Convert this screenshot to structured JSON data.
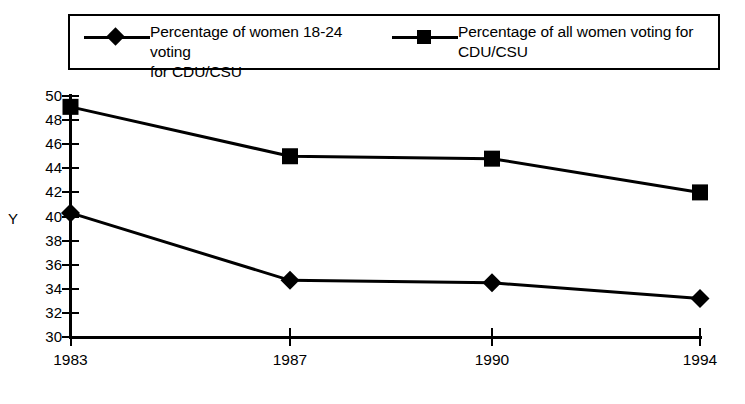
{
  "chart_data": {
    "type": "line",
    "title": "",
    "xlabel": "",
    "ylabel": "Y",
    "categories": [
      "1983",
      "1987",
      "1990",
      "1994"
    ],
    "ylim": [
      30,
      50
    ],
    "yticks": [
      30,
      32,
      34,
      36,
      38,
      40,
      42,
      44,
      46,
      48,
      50
    ],
    "ytick_labels": [
      "30",
      "32",
      "34",
      "36",
      "38",
      "40",
      "42",
      "44",
      "46",
      "48",
      "50"
    ],
    "grid": false,
    "legend_position": "top",
    "series": [
      {
        "name": "Percentage of women 18-24 voting for CDU/CSU",
        "legend_label": "Percentage of women 18-24 voting\nfor  CDU/CSU",
        "marker": "diamond",
        "color": "#000000",
        "values": [
          40.3,
          34.7,
          34.5,
          33.2
        ]
      },
      {
        "name": "Percentage of all women voting for CDU/CSU",
        "legend_label": "Percentage of all women voting for\nCDU/CSU",
        "marker": "square",
        "color": "#000000",
        "values": [
          49.1,
          45.0,
          44.8,
          42.0
        ]
      }
    ]
  },
  "legend": {
    "entries": [
      {
        "label": "Percentage of women 18-24 voting\nfor  CDU/CSU",
        "marker": "diamond"
      },
      {
        "label": "Percentage of all women voting for\nCDU/CSU",
        "marker": "square"
      }
    ]
  },
  "axes": {
    "y_axis_label": "Y",
    "x_tick_labels": [
      "1983",
      "1987",
      "1990",
      "1994"
    ],
    "y_tick_labels": [
      "50",
      "48",
      "46",
      "44",
      "42",
      "40",
      "38",
      "36",
      "34",
      "32",
      "30"
    ]
  }
}
